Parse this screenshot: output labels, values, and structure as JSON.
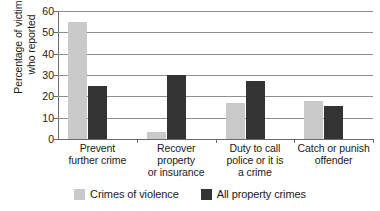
{
  "chart_data": {
    "type": "bar",
    "title": "",
    "xlabel": "",
    "ylabel": "Percentage of victims\nwho reported",
    "ylim": [
      0,
      60
    ],
    "ytick_values": [
      60,
      50,
      40,
      30,
      20,
      10,
      0
    ],
    "ytick_labels": [
      "60",
      "50",
      "40",
      "30",
      "20",
      "10",
      "0"
    ],
    "grid": "horizontal",
    "legend_position": "bottom-center",
    "categories": [
      "Prevent\nfurther crime",
      "Recover property\nor insurance",
      "Duty to call\npolice or it is\na crime",
      "Catch or punish\noffender"
    ],
    "series": [
      {
        "name": "Crimes of violence",
        "color": "#c9c9c9",
        "values": [
          55,
          3.5,
          17,
          18
        ]
      },
      {
        "name": "All property crimes",
        "color": "#333333",
        "values": [
          25,
          30,
          27,
          15.5
        ]
      }
    ]
  },
  "colors": {
    "gridline": "#8f8f8f",
    "axis": "#6a6a6a",
    "text": "#1a1a1a",
    "background": "#ffffff"
  }
}
